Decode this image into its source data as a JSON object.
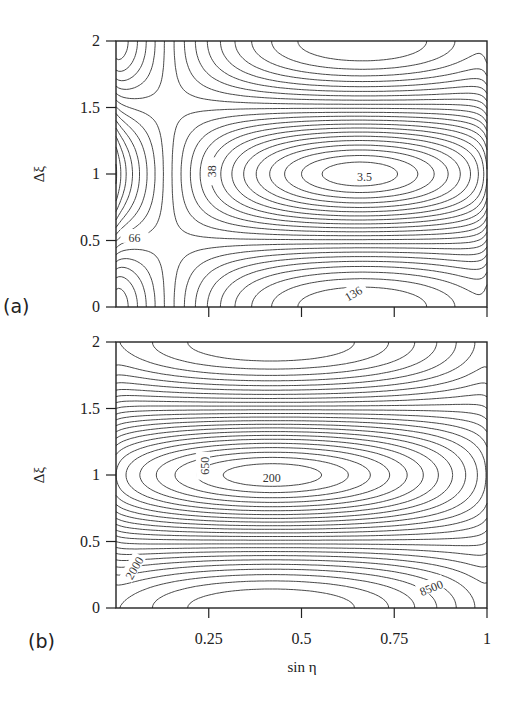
{
  "chart_data": [
    {
      "type": "contour",
      "panel_label": "(a)",
      "xlabel": "",
      "ylabel": "Δξ",
      "xlim": [
        0,
        1
      ],
      "ylim": [
        0,
        2
      ],
      "xticks": [
        0.25,
        0.5,
        0.75,
        1
      ],
      "xtick_labels": [],
      "yticks": [
        0,
        0.5,
        1,
        1.5,
        2
      ],
      "ytick_labels": [
        "0",
        "0.5",
        "1",
        "1.5",
        "2"
      ],
      "minimum": {
        "x": 0.66,
        "y": 1.0,
        "value": 3.5
      },
      "labeled_levels": [
        {
          "value": "3.5",
          "x": 0.67,
          "y": 0.98,
          "rotate": 0
        },
        {
          "value": "38",
          "x": 0.26,
          "y": 1.02,
          "rotate": -90
        },
        {
          "value": "66",
          "x": 0.05,
          "y": 0.52,
          "rotate": 0
        },
        {
          "value": "136",
          "x": 0.64,
          "y": 0.1,
          "rotate": -30
        }
      ],
      "field": {
        "M": 140,
        "a": 260,
        "x0": 0.66,
        "levels_count": 22,
        "min_value": 3.5
      }
    },
    {
      "type": "contour",
      "panel_label": "(b)",
      "xlabel": "sin η",
      "ylabel": "Δξ",
      "xlim": [
        0,
        1
      ],
      "ylim": [
        0,
        2
      ],
      "xticks": [
        0.25,
        0.5,
        0.75,
        1
      ],
      "xtick_labels": [
        "0.25",
        "0.5",
        "0.75",
        "1"
      ],
      "yticks": [
        0,
        0.5,
        1,
        1.5,
        2
      ],
      "ytick_labels": [
        "0",
        "0.5",
        "1",
        "1.5",
        "2"
      ],
      "minimum": {
        "x": 0.42,
        "y": 1.0,
        "value": 200
      },
      "labeled_levels": [
        {
          "value": "200",
          "x": 0.42,
          "y": 0.98,
          "rotate": 0
        },
        {
          "value": "650",
          "x": 0.24,
          "y": 1.07,
          "rotate": -90
        },
        {
          "value": "2000",
          "x": 0.05,
          "y": 0.3,
          "rotate": -60
        },
        {
          "value": "8500",
          "x": 0.85,
          "y": 0.15,
          "rotate": -22
        }
      ],
      "field": {
        "M": 9000,
        "a": 9000,
        "x0": 0.42,
        "levels_count": 24,
        "min_value": 200
      }
    }
  ],
  "figure": {
    "xlabel": "sin η",
    "panels": [
      "(a)",
      "(b)"
    ]
  }
}
